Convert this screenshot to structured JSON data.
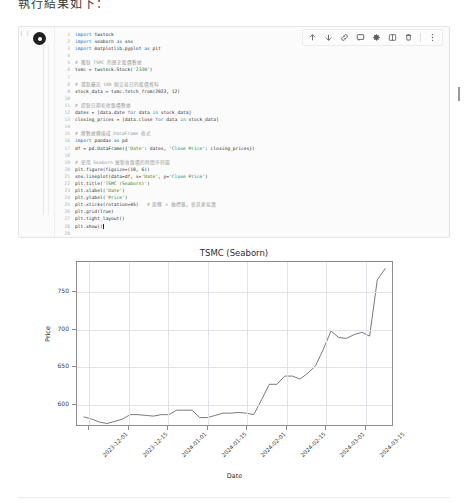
{
  "caption": "執行結果如下：",
  "toolbar": {
    "items": [
      {
        "name": "move-up-icon",
        "glyph": "arrow-up"
      },
      {
        "name": "move-down-icon",
        "glyph": "arrow-down"
      },
      {
        "name": "link-icon",
        "glyph": "link"
      },
      {
        "name": "comment-icon",
        "glyph": "comment"
      },
      {
        "name": "settings-icon",
        "glyph": "gear"
      },
      {
        "name": "mirror-icon",
        "glyph": "mirror"
      },
      {
        "name": "delete-icon",
        "glyph": "trash"
      },
      {
        "name": "more-options-icon",
        "glyph": "kebab"
      }
    ]
  },
  "cell": {
    "execution_label": "[ ]",
    "run_button_label": "run-cell",
    "lines": [
      {
        "n": "1",
        "text": "import twstock"
      },
      {
        "n": "2",
        "text": "import seaborn as sns"
      },
      {
        "n": "3",
        "text": "import matplotlib.pyplot as plt"
      },
      {
        "n": "4",
        "text": ""
      },
      {
        "n": "5",
        "text": "# 獲取 TSMC 的歷史股價數據"
      },
      {
        "n": "6",
        "text": "tsmc = twstock.Stock('2330')"
      },
      {
        "n": "7",
        "text": ""
      },
      {
        "n": "8",
        "text": "# 選取最近 100 個交易日的股價資料"
      },
      {
        "n": "9",
        "text": "stock_data = tsmc.fetch_from(2023, 12)"
      },
      {
        "n": "10",
        "text": ""
      },
      {
        "n": "11",
        "text": "# 提取日期和收盤價數據"
      },
      {
        "n": "12",
        "text": "dates = [data.date for data in stock_data]"
      },
      {
        "n": "13",
        "text": "closing_prices = [data.close for data in stock_data]"
      },
      {
        "n": "14",
        "text": ""
      },
      {
        "n": "15",
        "text": "# 將數據轉換成 DataFrame 格式"
      },
      {
        "n": "16",
        "text": "import pandas as pd"
      },
      {
        "n": "17",
        "text": "df = pd.DataFrame({'Date': dates, 'Close Price': closing_prices})"
      },
      {
        "n": "18",
        "text": ""
      },
      {
        "n": "19",
        "text": "# 使用 Seaborn 繪製收盤價的時間序列圖"
      },
      {
        "n": "20",
        "text": "plt.figure(figsize=(10, 6))"
      },
      {
        "n": "21",
        "text": "sns.lineplot(data=df, x='Date', y='Close Price')"
      },
      {
        "n": "22",
        "text": "plt.title('TSMC (Seaborn)')"
      },
      {
        "n": "23",
        "text": "plt.xlabel('Date')"
      },
      {
        "n": "24",
        "text": "plt.ylabel('Price')"
      },
      {
        "n": "25",
        "text": "plt.xticks(rotation=45)   # 旋轉 x 軸標籤，使其更易讀"
      },
      {
        "n": "26",
        "text": "plt.grid(True)"
      },
      {
        "n": "27",
        "text": "plt.tight_layout()"
      },
      {
        "n": "28",
        "text": "plt.show()"
      },
      {
        "n": "29",
        "text": ""
      }
    ]
  },
  "chart_data": {
    "type": "line",
    "title": "TSMC (Seaborn)",
    "xlabel": "Date",
    "ylabel": "Price",
    "grid": true,
    "legend": null,
    "ylim": [
      570,
      790
    ],
    "yticks": [
      600,
      650,
      700,
      750
    ],
    "xticks": [
      "2023-12-01",
      "2023-12-15",
      "2024-01-01",
      "2024-01-15",
      "2024-02-01",
      "2024-02-15",
      "2024-03-01",
      "2024-03-15"
    ],
    "line_color": "#6a6a6a",
    "x": [
      "2023-12-01",
      "2023-12-04",
      "2023-12-06",
      "2023-12-08",
      "2023-12-11",
      "2023-12-13",
      "2023-12-15",
      "2023-12-19",
      "2023-12-21",
      "2023-12-25",
      "2023-12-27",
      "2023-12-29",
      "2024-01-02",
      "2024-01-04",
      "2024-01-08",
      "2024-01-10",
      "2024-01-12",
      "2024-01-16",
      "2024-01-18",
      "2024-01-22",
      "2024-01-24",
      "2024-01-26",
      "2024-01-30",
      "2024-02-01",
      "2024-02-05",
      "2024-02-15",
      "2024-02-17",
      "2024-02-20",
      "2024-02-22",
      "2024-02-26",
      "2024-02-29",
      "2024-03-04",
      "2024-03-06",
      "2024-03-08",
      "2024-03-11",
      "2024-03-13",
      "2024-03-15",
      "2024-03-19",
      "2024-03-21",
      "2024-03-25"
    ],
    "values": [
      581,
      578,
      574,
      572,
      575,
      578,
      584,
      584,
      583,
      582,
      584,
      584,
      590,
      590,
      590,
      580,
      580,
      583,
      586,
      586,
      587,
      586,
      584,
      604,
      625,
      625,
      636,
      636,
      632,
      640,
      650,
      672,
      697,
      688,
      687,
      692,
      695,
      690,
      766,
      781
    ],
    "series_path": "M 0,121 L 8,130 L 16,141 L 24,146 L 31,139 L 39,131 L 47,118 L 55,118 L 63,120 L 71,122 L 79,118 L 87,118 L 95,105 L 103,105 L 111,105 L 119,127 L 127,127 L 135,120 L 143,114 L 151,114 L 159,112 L 167,114 L 175,118 L 183,75 L 191,29 L 199,29 L 207,7 L 215,7 L 223,15 L 231,1 L 239,-18 L 247,-64 L 255,-108 L 263,-92 L 271,-90 L 279,-100 L 287,-106 L 295,-98 L 303,-235 L 311,-262"
  }
}
